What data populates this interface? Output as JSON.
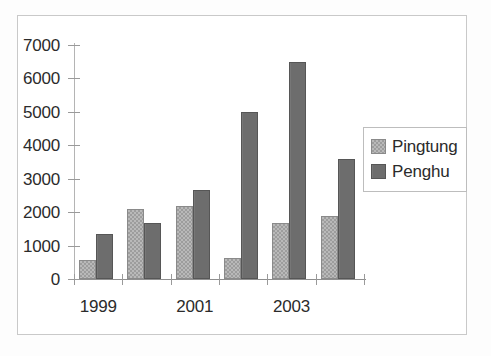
{
  "chart_data": {
    "type": "bar",
    "title": "",
    "subtitle": "",
    "xlabel": "",
    "ylabel": "",
    "categories": [
      "1999",
      "2000",
      "2001",
      "2002",
      "2003",
      "2004"
    ],
    "tick_labels_x": [
      "1999",
      "",
      "2001",
      "",
      "2003",
      ""
    ],
    "tick_labels_y": [
      "0",
      "1000",
      "2000",
      "3000",
      "4000",
      "5000",
      "6000",
      "7000"
    ],
    "ytick_values": [
      0,
      1000,
      2000,
      3000,
      4000,
      5000,
      6000,
      7000
    ],
    "ylim": [
      0,
      7000
    ],
    "grid": false,
    "legend_position": "right",
    "series": [
      {
        "name": "Pingtung",
        "color": "#b9b9b9",
        "pattern": "checkered",
        "values": [
          560,
          2080,
          2170,
          620,
          1680,
          1890
        ]
      },
      {
        "name": "Penghu",
        "color": "#6d6d6d",
        "pattern": "solid",
        "values": [
          1350,
          1680,
          2670,
          5000,
          6480,
          3580
        ]
      }
    ]
  },
  "legend": {
    "items": [
      {
        "label": "Pingtung"
      },
      {
        "label": "Penghu"
      }
    ]
  },
  "frame": {
    "border_color": "#c9c9c9",
    "background": "#ffffff"
  }
}
